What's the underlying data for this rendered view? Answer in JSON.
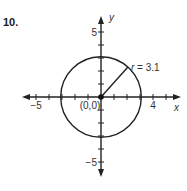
{
  "problem_number": "10.",
  "diagram": {
    "type": "coordinate-plane-circle",
    "axes": {
      "x_label": "x",
      "y_label": "y",
      "x_range": [
        -6,
        6
      ],
      "y_range": [
        -6,
        6
      ],
      "tick_step": 1,
      "x_tick_labels": [
        {
          "value": -5,
          "text": "−5"
        },
        {
          "value": 4,
          "text": "4"
        }
      ],
      "y_tick_labels": [
        {
          "value": 5,
          "text": "5"
        },
        {
          "value": -5,
          "text": "−5"
        }
      ]
    },
    "circle": {
      "center": [
        0,
        0
      ],
      "radius": 3.1,
      "center_label": "(0,0)",
      "radius_label": "r = 3.1",
      "radius_angle_deg": 48
    },
    "colors": {
      "stroke": "#222222",
      "text": "#333333",
      "background": "#ffffff"
    }
  }
}
